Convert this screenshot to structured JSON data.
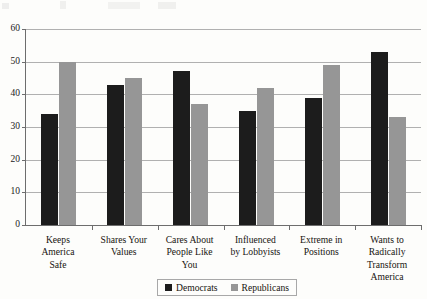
{
  "chart_data": {
    "type": "bar",
    "title": "",
    "subtitle": "",
    "xlabel": "",
    "ylabel": "",
    "ylim": [
      0,
      60
    ],
    "yticks": [
      0,
      10,
      20,
      30,
      40,
      50,
      60
    ],
    "grid": true,
    "legend_position": "bottom-right",
    "orientation": "vertical",
    "grouping": "grouped",
    "categories": [
      "Keeps\nAmerica\nSafe",
      "Shares Your\nValues",
      "Cares About\nPeople Like\nYou",
      "Influenced\nby Lobbyists",
      "Extreme in\nPositions",
      "Wants to\nRadically\nTransform\nAmerica"
    ],
    "series": [
      {
        "name": "Democrats",
        "color": "#1c1c1c",
        "values": [
          34,
          43,
          47,
          35,
          39,
          53
        ]
      },
      {
        "name": "Republicans",
        "color": "#969696",
        "values": [
          50,
          45,
          37,
          42,
          49,
          33
        ]
      }
    ]
  },
  "axis": {
    "y_tick_labels": [
      "0",
      "10",
      "20",
      "30",
      "40",
      "50",
      "60"
    ]
  },
  "legend": {
    "entries": [
      {
        "label": "Democrats",
        "swatch": "dem"
      },
      {
        "label": "Republicans",
        "swatch": "rep"
      }
    ]
  }
}
